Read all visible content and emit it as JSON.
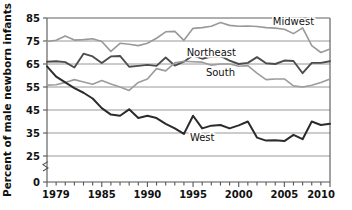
{
  "chart_data": {
    "type": "line",
    "title": "",
    "xlabel": "",
    "ylabel": "Percent of male newborn infants",
    "xlim": [
      1979,
      2010
    ],
    "ylim": [
      25,
      85
    ],
    "y_axis_break": true,
    "y_axis_break_note": "axis broken between 0 and 25",
    "grid": true,
    "grid_orientation": "horizontal",
    "legend_position": "inline-labels",
    "x_tick_labels": [
      "1979",
      "1985",
      "1990",
      "1995",
      "2000",
      "2005",
      "2010"
    ],
    "x_tick_values": [
      1979,
      1985,
      1990,
      1995,
      2000,
      2005,
      2010
    ],
    "x_minor_tick_interval": 1,
    "y_tick_labels": [
      "0",
      "25",
      "35",
      "45",
      "55",
      "65",
      "75",
      "85"
    ],
    "y_tick_values": [
      0,
      25,
      35,
      45,
      55,
      65,
      75,
      85
    ],
    "x": [
      1979,
      1980,
      1981,
      1982,
      1983,
      1984,
      1985,
      1986,
      1987,
      1988,
      1989,
      1990,
      1991,
      1992,
      1993,
      1994,
      1995,
      1996,
      1997,
      1998,
      1999,
      2000,
      2001,
      2002,
      2003,
      2004,
      2005,
      2006,
      2007,
      2008,
      2009,
      2010
    ],
    "series": [
      {
        "name": "Midwest",
        "color": "#999999",
        "width": 1.6,
        "label_x": 2006,
        "label_y": 83.5,
        "values": [
          74.8,
          75.3,
          77.2,
          75.4,
          75.6,
          76.0,
          74.8,
          70.5,
          74.0,
          73.6,
          73.0,
          74.0,
          76.2,
          79.0,
          79.2,
          75.3,
          80.5,
          80.8,
          81.4,
          83.0,
          81.8,
          81.4,
          81.5,
          81.3,
          80.8,
          80.6,
          80.1,
          78.2,
          80.7,
          73.0,
          70.0,
          71.5
        ]
      },
      {
        "name": "Northeast",
        "color": "#4d4d4d",
        "width": 1.9,
        "label_x": 1997,
        "label_y": 70.0,
        "values": [
          66.0,
          66.2,
          65.8,
          63.5,
          69.5,
          68.3,
          65.4,
          68.3,
          68.5,
          63.8,
          64.2,
          64.6,
          64.2,
          67.8,
          64.3,
          66.0,
          68.8,
          67.3,
          68.2,
          68.5,
          66.5,
          65.0,
          65.5,
          68.0,
          65.3,
          65.0,
          66.5,
          66.3,
          61.0,
          65.5,
          65.5,
          66.2
        ]
      },
      {
        "name": "South",
        "color": "#9c9c9c",
        "width": 1.6,
        "label_x": 1998,
        "label_y": 61.5,
        "values": [
          55.8,
          56.0,
          57.0,
          58.2,
          57.2,
          56.2,
          57.8,
          56.3,
          55.0,
          53.5,
          57.0,
          58.5,
          63.0,
          62.0,
          65.5,
          66.2,
          66.0,
          65.8,
          64.5,
          65.0,
          65.0,
          64.0,
          64.3,
          61.0,
          58.2,
          58.5,
          58.5,
          55.5,
          55.0,
          55.8,
          57.0,
          58.5
        ]
      },
      {
        "name": "West",
        "color": "#2b2b2b",
        "width": 2.0,
        "label_x": 1996,
        "label_y": 33.0,
        "values": [
          64.0,
          59.5,
          57.0,
          54.5,
          52.5,
          50.0,
          45.8,
          43.0,
          42.5,
          45.3,
          41.5,
          42.5,
          41.5,
          39.0,
          37.0,
          34.6,
          42.5,
          37.0,
          38.2,
          38.5,
          37.0,
          38.3,
          40.0,
          33.0,
          31.7,
          31.8,
          31.5,
          34.2,
          32.3,
          40.0,
          38.5,
          39.0
        ]
      }
    ]
  },
  "axis": {
    "y_title": "Percent of male newborn infants"
  }
}
